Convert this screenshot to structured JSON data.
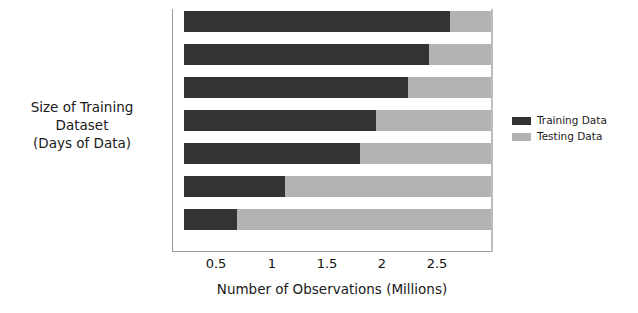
{
  "chart_data": {
    "type": "bar",
    "orientation": "horizontal",
    "stacked": true,
    "title": "",
    "xlabel": "Number of Observations (Millions)",
    "ylabel": "Size of Training Dataset (Days of Data)",
    "ylabel_lines": [
      "Size of Training",
      "Dataset",
      "(Days of Data)"
    ],
    "categories": [
      "1",
      "2",
      "3",
      "4",
      "5",
      "6",
      "7"
    ],
    "category_order_top_to_bottom": [
      "7",
      "6",
      "5",
      "4",
      "3",
      "2",
      "1"
    ],
    "bar_start": 0.1,
    "series": [
      {
        "name": "Training Data",
        "color": "#333333",
        "values": [
          0.6,
          1.05,
          1.75,
          1.9,
          2.2,
          2.4,
          2.6
        ]
      },
      {
        "name": "Testing Data",
        "color": "#b3b3b3",
        "values": [
          2.4,
          1.95,
          1.25,
          1.1,
          0.8,
          0.6,
          0.4
        ]
      }
    ],
    "segment_ends": {
      "7": {
        "training_end": 2.6,
        "total": 3.0
      },
      "6": {
        "training_end": 2.4,
        "total": 3.0
      },
      "5": {
        "training_end": 2.2,
        "total": 3.0
      },
      "4": {
        "training_end": 1.9,
        "total": 3.0
      },
      "3": {
        "training_end": 1.75,
        "total": 3.0
      },
      "2": {
        "training_end": 1.05,
        "total": 3.0
      },
      "1": {
        "training_end": 0.6,
        "total": 3.0
      }
    },
    "xlim": [
      0,
      3.0
    ],
    "xticks": [
      0.5,
      1,
      1.5,
      2,
      2.5
    ],
    "xtick_labels": [
      "0.5",
      "1",
      "1.5",
      "2",
      "2.5"
    ],
    "yticks": [
      0,
      1,
      2,
      3,
      4,
      5,
      6,
      7
    ],
    "ytick_labels": [
      "7",
      "6",
      "5",
      "4",
      "3",
      "2",
      "1",
      "0"
    ],
    "grid": false,
    "legend_position": "right",
    "legend": [
      {
        "label": "Training Data",
        "color": "#333333",
        "swatch": "swatch-training"
      },
      {
        "label": "Testing Data",
        "color": "#b3b3b3",
        "swatch": "swatch-testing"
      }
    ],
    "axis_color": "#9a9a9a",
    "background": "#ffffff"
  }
}
